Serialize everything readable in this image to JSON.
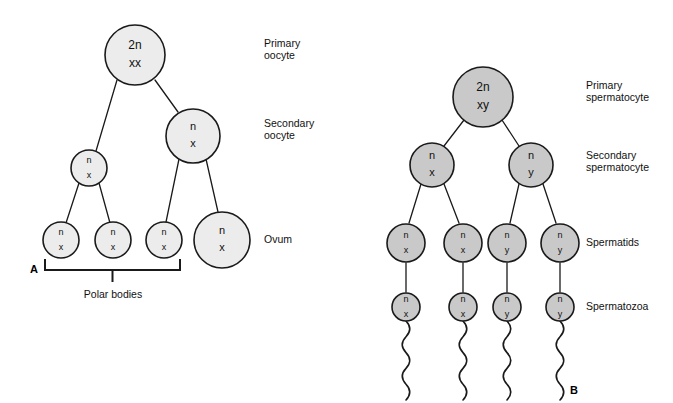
{
  "figure": {
    "panels": [
      {
        "letter": "A",
        "name": "oogenesis",
        "letter_x": 30,
        "letter_y": 270,
        "fill_color": "#ececec",
        "stroke_color": "#1a1a1a",
        "cells": [
          {
            "id": "primary-oocyte",
            "line1": "2n",
            "line2": "xx",
            "cx": 135,
            "cy": 55,
            "r": 30,
            "size": "big"
          },
          {
            "id": "secondary-oocyte",
            "line1": "n",
            "line2": "x",
            "cx": 193,
            "cy": 136,
            "r": 27,
            "size": "normal"
          },
          {
            "id": "first-polar-body",
            "line1": "n",
            "line2": "x",
            "cx": 89,
            "cy": 168,
            "r": 18,
            "size": "small"
          },
          {
            "id": "polar-body-1",
            "line1": "n",
            "line2": "x",
            "cx": 61,
            "cy": 240,
            "r": 18,
            "size": "small"
          },
          {
            "id": "polar-body-2",
            "line1": "n",
            "line2": "x",
            "cx": 113,
            "cy": 240,
            "r": 18,
            "size": "small"
          },
          {
            "id": "polar-body-3",
            "line1": "n",
            "line2": "x",
            "cx": 164,
            "cy": 240,
            "r": 18,
            "size": "small"
          },
          {
            "id": "ovum",
            "line1": "n",
            "line2": "x",
            "cx": 222,
            "cy": 240,
            "r": 28,
            "size": "normal"
          }
        ],
        "connectors": [
          {
            "id": "primary-to-first-polar",
            "x1": 117,
            "y1": 80,
            "x2": 96,
            "y2": 151
          },
          {
            "id": "primary-to-secondary",
            "x1": 155,
            "y1": 80,
            "x2": 178,
            "y2": 112
          },
          {
            "id": "first-polar-to-pb1",
            "x1": 79,
            "y1": 183,
            "x2": 66,
            "y2": 223
          },
          {
            "id": "first-polar-to-pb2",
            "x1": 99,
            "y1": 183,
            "x2": 110,
            "y2": 223
          },
          {
            "id": "secondary-to-pb3",
            "x1": 179,
            "y1": 159,
            "x2": 166,
            "y2": 222
          },
          {
            "id": "secondary-to-ovum",
            "x1": 206,
            "y1": 159,
            "x2": 218,
            "y2": 212
          }
        ],
        "bracket": {
          "id": "polar-bodies-bracket",
          "caption": "Polar bodies",
          "x_left": 45,
          "x_right": 180,
          "y": 270,
          "arm": 11,
          "tick_down": 12,
          "caption_x": 113,
          "caption_y": 295
        },
        "labels": [
          {
            "id": "label-primary-oocyte",
            "lines": [
              "Primary",
              "oocyte"
            ],
            "x": 264,
            "y": 50
          },
          {
            "id": "label-secondary-oocyte",
            "lines": [
              "Secondary",
              "oocyte"
            ],
            "x": 264,
            "y": 130
          },
          {
            "id": "label-ovum",
            "lines": [
              "Ovum"
            ],
            "x": 264,
            "y": 240
          }
        ]
      },
      {
        "letter": "B",
        "name": "spermatogenesis",
        "letter_x": 570,
        "letter_y": 391,
        "fill_color": "#c9c9c9",
        "stroke_color": "#1a1a1a",
        "cells": [
          {
            "id": "primary-spermatocyte",
            "line1": "2n",
            "line2": "xy",
            "cx": 483,
            "cy": 97,
            "r": 30,
            "size": "big"
          },
          {
            "id": "secondary-spermatocyte-x",
            "line1": "n",
            "line2": "x",
            "cx": 432,
            "cy": 165,
            "r": 22,
            "size": "normal"
          },
          {
            "id": "secondary-spermatocyte-y",
            "line1": "n",
            "line2": "y",
            "cx": 531,
            "cy": 165,
            "r": 22,
            "size": "normal"
          },
          {
            "id": "spermatid-1",
            "line1": "n",
            "line2": "x",
            "cx": 406,
            "cy": 243,
            "r": 19,
            "size": "small"
          },
          {
            "id": "spermatid-2",
            "line1": "n",
            "line2": "x",
            "cx": 463,
            "cy": 243,
            "r": 19,
            "size": "small"
          },
          {
            "id": "spermatid-3",
            "line1": "n",
            "line2": "y",
            "cx": 507,
            "cy": 243,
            "r": 19,
            "size": "small"
          },
          {
            "id": "spermatid-4",
            "line1": "n",
            "line2": "y",
            "cx": 560,
            "cy": 243,
            "r": 19,
            "size": "small"
          },
          {
            "id": "spermatozoon-1",
            "line1": "n",
            "line2": "x",
            "cx": 406,
            "cy": 307,
            "r": 14,
            "size": "small"
          },
          {
            "id": "spermatozoon-2",
            "line1": "n",
            "line2": "x",
            "cx": 463,
            "cy": 307,
            "r": 14,
            "size": "small"
          },
          {
            "id": "spermatozoon-3",
            "line1": "n",
            "line2": "y",
            "cx": 507,
            "cy": 307,
            "r": 14,
            "size": "small"
          },
          {
            "id": "spermatozoon-4",
            "line1": "n",
            "line2": "y",
            "cx": 560,
            "cy": 307,
            "r": 14,
            "size": "small"
          }
        ],
        "connectors": [
          {
            "id": "primary-to-sec-x",
            "x1": 464,
            "y1": 120,
            "x2": 444,
            "y2": 146
          },
          {
            "id": "primary-to-sec-y",
            "x1": 502,
            "y1": 120,
            "x2": 519,
            "y2": 146
          },
          {
            "id": "sec-x-to-spt1",
            "x1": 421,
            "y1": 184,
            "x2": 409,
            "y2": 223
          },
          {
            "id": "sec-x-to-spt2",
            "x1": 444,
            "y1": 184,
            "x2": 459,
            "y2": 223
          },
          {
            "id": "sec-y-to-spt3",
            "x1": 519,
            "y1": 184,
            "x2": 510,
            "y2": 223
          },
          {
            "id": "sec-y-to-spt4",
            "x1": 543,
            "y1": 184,
            "x2": 556,
            "y2": 223
          },
          {
            "id": "spt1-to-spz1",
            "x1": 406,
            "y1": 263,
            "x2": 406,
            "y2": 292
          },
          {
            "id": "spt2-to-spz2",
            "x1": 463,
            "y1": 263,
            "x2": 463,
            "y2": 292
          },
          {
            "id": "spt3-to-spz3",
            "x1": 507,
            "y1": 263,
            "x2": 507,
            "y2": 292
          },
          {
            "id": "spt4-to-spz4",
            "x1": 560,
            "y1": 263,
            "x2": 560,
            "y2": 292
          }
        ],
        "tails": [
          {
            "id": "tail-1",
            "x": 406,
            "y_start": 321,
            "y_end": 400
          },
          {
            "id": "tail-2",
            "x": 463,
            "y_start": 321,
            "y_end": 400
          },
          {
            "id": "tail-3",
            "x": 507,
            "y_start": 321,
            "y_end": 400
          },
          {
            "id": "tail-4",
            "x": 560,
            "y_start": 321,
            "y_end": 400
          }
        ],
        "labels": [
          {
            "id": "label-primary-spermatocyte",
            "lines": [
              "Primary",
              "spermatocyte"
            ],
            "x": 586,
            "y": 92
          },
          {
            "id": "label-secondary-spermatocyte",
            "lines": [
              "Secondary",
              "spermatocyte"
            ],
            "x": 586,
            "y": 162
          },
          {
            "id": "label-spermatids",
            "lines": [
              "Spermatids"
            ],
            "x": 586,
            "y": 243
          },
          {
            "id": "label-spermatozoa",
            "lines": [
              "Spermatozoa"
            ],
            "x": 586,
            "y": 307
          }
        ]
      }
    ]
  }
}
